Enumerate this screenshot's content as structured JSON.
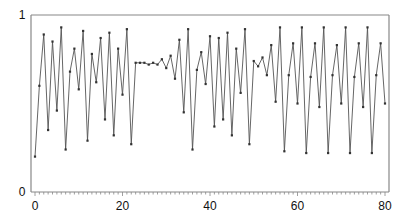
{
  "chart_data": {
    "type": "line",
    "title": "",
    "xlabel": "",
    "ylabel": "",
    "xlim": [
      0,
      80
    ],
    "ylim": [
      0,
      1
    ],
    "grid": false,
    "legend": null,
    "x_tick_labels": [
      "0",
      "20",
      "40",
      "60",
      "80"
    ],
    "y_tick_labels": [
      "0",
      "1"
    ],
    "marker": "dot",
    "line_color": "#444444",
    "x": [
      0,
      1,
      2,
      3,
      4,
      5,
      6,
      7,
      8,
      9,
      10,
      11,
      12,
      13,
      14,
      15,
      16,
      17,
      18,
      19,
      20,
      21,
      22,
      23,
      24,
      25,
      26,
      27,
      28,
      29,
      30,
      31,
      32,
      33,
      34,
      35,
      36,
      37,
      38,
      39,
      40,
      41,
      42,
      43,
      44,
      45,
      46,
      47,
      48,
      49,
      50,
      51,
      52,
      53,
      54,
      55,
      56,
      57,
      58,
      59,
      60,
      61,
      62,
      63,
      64,
      65,
      66,
      67,
      68,
      69,
      70,
      71,
      72,
      73,
      74,
      75,
      76,
      77,
      78,
      79,
      80
    ],
    "values": [
      0.2,
      0.6,
      0.89,
      0.35,
      0.85,
      0.46,
      0.93,
      0.24,
      0.68,
      0.81,
      0.58,
      0.91,
      0.29,
      0.78,
      0.62,
      0.87,
      0.41,
      0.9,
      0.32,
      0.81,
      0.55,
      0.92,
      0.27,
      0.73,
      0.73,
      0.73,
      0.72,
      0.73,
      0.72,
      0.75,
      0.7,
      0.77,
      0.64,
      0.86,
      0.45,
      0.92,
      0.24,
      0.69,
      0.79,
      0.61,
      0.88,
      0.37,
      0.87,
      0.41,
      0.9,
      0.32,
      0.81,
      0.56,
      0.92,
      0.27,
      0.74,
      0.71,
      0.76,
      0.66,
      0.83,
      0.51,
      0.93,
      0.23,
      0.66,
      0.84,
      0.5,
      0.93,
      0.22,
      0.65,
      0.84,
      0.48,
      0.93,
      0.22,
      0.66,
      0.83,
      0.5,
      0.93,
      0.22,
      0.65,
      0.84,
      0.48,
      0.93,
      0.22,
      0.66,
      0.84,
      0.5
    ]
  },
  "axes": {
    "y_top_label": "1",
    "y_bottom_label": "0",
    "x_labels": [
      "0",
      "20",
      "40",
      "60",
      "80"
    ]
  }
}
